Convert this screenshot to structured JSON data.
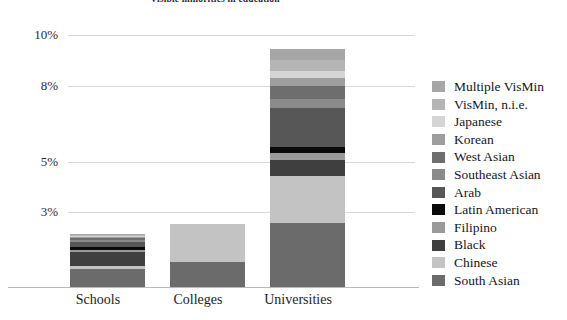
{
  "chart_data": {
    "type": "bar",
    "subtype": "stacked-bar",
    "title": "Visible minorities in education",
    "xlabel": "",
    "ylabel": "",
    "categories": [
      "Schools",
      "Colleges",
      "Universities"
    ],
    "ytick_labels": [
      "10%",
      "8%",
      "5%",
      "3%"
    ],
    "ytick_values": [
      10,
      8,
      5,
      3
    ],
    "ylim": [
      0,
      10.6
    ],
    "grid": true,
    "legend_position": "right",
    "totals": [
      2.1,
      2.5,
      9.4
    ],
    "series": [
      {
        "name": "South Asian",
        "color": "#6b6b6b",
        "values": [
          0.72,
          1.0,
          2.55
        ]
      },
      {
        "name": "Chinese",
        "color": "#c3c3c3",
        "values": [
          0.1,
          1.5,
          1.85
        ]
      },
      {
        "name": "Black",
        "color": "#3f3f3f",
        "values": [
          0.55,
          0.0,
          0.62
        ]
      },
      {
        "name": "Filipino",
        "color": "#9a9a9a",
        "values": [
          0.1,
          0.0,
          0.28
        ]
      },
      {
        "name": "Latin American",
        "color": "#0a0a0a",
        "values": [
          0.12,
          0.0,
          0.22
        ]
      },
      {
        "name": "Arab",
        "color": "#575757",
        "values": [
          0.2,
          0.0,
          1.55
        ]
      },
      {
        "name": "Southeast Asian",
        "color": "#8b8b8b",
        "values": [
          0.08,
          0.0,
          0.38
        ]
      },
      {
        "name": "West Asian",
        "color": "#6e6e6e",
        "values": [
          0.06,
          0.0,
          0.5
        ]
      },
      {
        "name": "Korean",
        "color": "#9e9e9e",
        "values": [
          0.05,
          0.0,
          0.32
        ]
      },
      {
        "name": "Japanese",
        "color": "#d5d5d5",
        "values": [
          0.04,
          0.0,
          0.26
        ]
      },
      {
        "name": "VisMin, n.i.e.",
        "color": "#b5b5b5",
        "values": [
          0.04,
          0.0,
          0.45
        ]
      },
      {
        "name": "Multiple VisMin",
        "color": "#a6a6a6",
        "values": [
          0.04,
          0.0,
          0.42
        ]
      }
    ],
    "legend_entries": [
      {
        "label": "Multiple VisMin",
        "color": "#a6a6a6"
      },
      {
        "label": "VisMin, n.i.e.",
        "color": "#b5b5b5"
      },
      {
        "label": "Japanese",
        "color": "#d5d5d5"
      },
      {
        "label": "Korean",
        "color": "#9e9e9e"
      },
      {
        "label": "West Asian",
        "color": "#6e6e6e"
      },
      {
        "label": "Southeast Asian",
        "color": "#8b8b8b"
      },
      {
        "label": "Arab",
        "color": "#575757"
      },
      {
        "label": "Latin American",
        "color": "#0a0a0a"
      },
      {
        "label": "Filipino",
        "color": "#9a9a9a"
      },
      {
        "label": "Black",
        "color": "#3f3f3f"
      },
      {
        "label": "Chinese",
        "color": "#c3c3c3"
      },
      {
        "label": "South Asian",
        "color": "#6b6b6b"
      }
    ]
  },
  "colors": {
    "background": "#ffffff",
    "text": "#1a1a1a",
    "gridline": "#d8d8dc",
    "axis": "#b9b9bd"
  }
}
